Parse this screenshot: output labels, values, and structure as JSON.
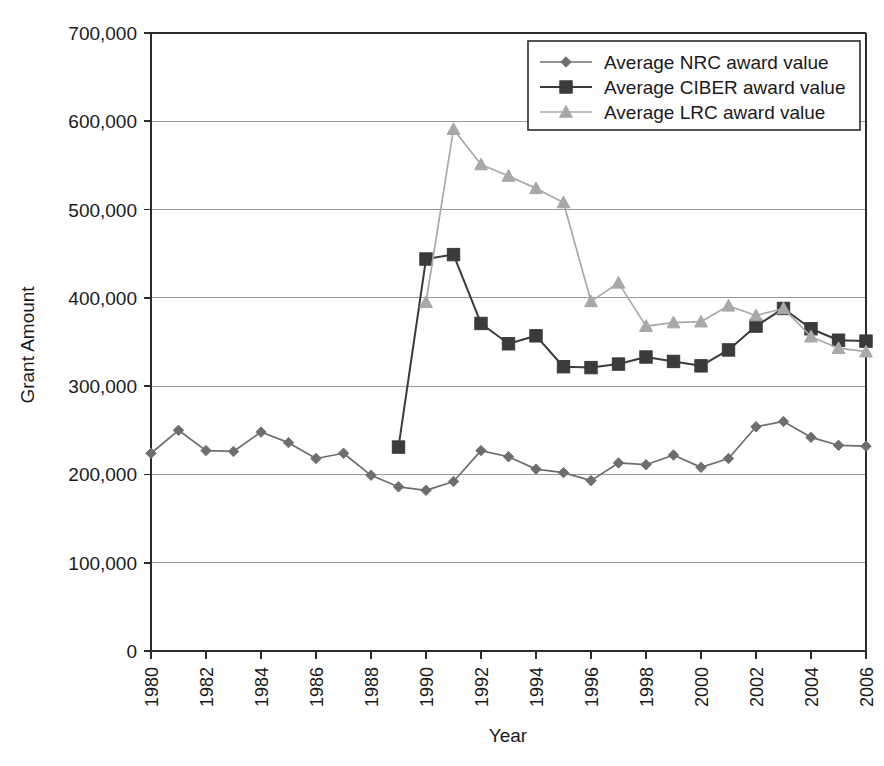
{
  "chart_data": {
    "type": "line",
    "title": "",
    "xlabel": "Year",
    "ylabel": "Grant Amount",
    "grid": true,
    "legend_position": "top-right",
    "xlim": [
      1980,
      2006
    ],
    "ylim": [
      0,
      700000
    ],
    "ytick_labels": [
      "700,000",
      "600,000",
      "500,000",
      "400,000",
      "300,000",
      "200,000",
      "100,000",
      "0"
    ],
    "ytick_values": [
      700000,
      600000,
      500000,
      400000,
      300000,
      200000,
      100000,
      0
    ],
    "xtick_labels": [
      "1980",
      "1982",
      "1984",
      "1986",
      "1988",
      "1990",
      "1992",
      "1994",
      "1996",
      "1998",
      "2000",
      "2002",
      "2004",
      "2006"
    ],
    "xtick_values": [
      1980,
      1982,
      1984,
      1986,
      1988,
      1990,
      1992,
      1994,
      1996,
      1998,
      2000,
      2002,
      2004,
      2006
    ],
    "x": [
      1980,
      1981,
      1982,
      1983,
      1984,
      1985,
      1986,
      1987,
      1988,
      1989,
      1990,
      1991,
      1992,
      1993,
      1994,
      1995,
      1996,
      1997,
      1998,
      1999,
      2000,
      2001,
      2002,
      2003,
      2004,
      2005,
      2006
    ],
    "series": [
      {
        "name": "Average NRC award value",
        "marker": "diamond",
        "color": "#6e6e6e",
        "x": [
          1980,
          1981,
          1982,
          1983,
          1984,
          1985,
          1986,
          1987,
          1988,
          1989,
          1990,
          1991,
          1992,
          1993,
          1994,
          1995,
          1996,
          1997,
          1998,
          1999,
          2000,
          2001,
          2002,
          2003,
          2004,
          2005,
          2006
        ],
        "values": [
          224000,
          250000,
          227000,
          226000,
          248000,
          236000,
          218000,
          224000,
          199000,
          186000,
          182000,
          192000,
          227000,
          220000,
          206000,
          202000,
          193000,
          213000,
          211000,
          222000,
          208000,
          218000,
          254000,
          260000,
          242000,
          233000,
          232000
        ]
      },
      {
        "name": "Average CIBER award value",
        "marker": "square",
        "color": "#3b3b3b",
        "x": [
          1989,
          1990,
          1991,
          1992,
          1993,
          1994,
          1995,
          1996,
          1997,
          1998,
          1999,
          2000,
          2001,
          2002,
          2003,
          2004,
          2005,
          2006
        ],
        "values": [
          231000,
          444000,
          449000,
          371000,
          348000,
          357000,
          322000,
          321000,
          325000,
          333000,
          328000,
          323000,
          341000,
          368000,
          388000,
          365000,
          352000,
          351000
        ]
      },
      {
        "name": "Average LRC award value",
        "marker": "triangle",
        "color": "#a8a8a8",
        "x": [
          1990,
          1991,
          1992,
          1993,
          1994,
          1995,
          1996,
          1997,
          1998,
          1999,
          2000,
          2001,
          2002,
          2003,
          2004,
          2005,
          2006
        ],
        "values": [
          395000,
          591000,
          551000,
          538000,
          524000,
          508000,
          396000,
          417000,
          368000,
          372000,
          373000,
          391000,
          380000,
          388000,
          356000,
          343000,
          339000
        ]
      }
    ]
  },
  "legend": {
    "items": [
      {
        "label": "Average NRC award value"
      },
      {
        "label": "Average CIBER award value"
      },
      {
        "label": "Average LRC award value"
      }
    ]
  },
  "axes": {
    "x_title": "Year",
    "y_title": "Grant Amount"
  },
  "colors": {
    "nrc": "#6e6e6e",
    "ciber": "#3b3b3b",
    "lrc": "#a8a8a8",
    "axis": "#2b2b2b",
    "grid": "#9a9a9a",
    "background": "#ffffff"
  }
}
